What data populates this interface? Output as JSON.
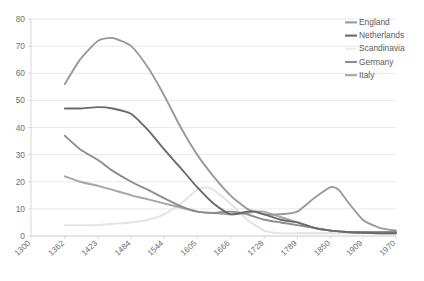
{
  "chart_data": {
    "type": "line",
    "title": "",
    "subtitle": "",
    "xlabel": "",
    "ylabel": "",
    "xlim": [
      1300,
      1970
    ],
    "ylim": [
      0,
      80
    ],
    "y_ticks": [
      0,
      10,
      20,
      30,
      40,
      50,
      60,
      70,
      80
    ],
    "x_ticks": [
      1300,
      1362,
      1423,
      1484,
      1544,
      1605,
      1666,
      1728,
      1789,
      1850,
      1909,
      1970
    ],
    "x_tick_labels": [
      "1300",
      "1362",
      "1423",
      "1484",
      "1544",
      "1605",
      "1666",
      "1728",
      "1789",
      "1850",
      "1909",
      "1970"
    ],
    "y_tick_labels": [
      "0",
      "10",
      "20",
      "30",
      "40",
      "50",
      "60",
      "70",
      "80"
    ],
    "grid": "horizontal",
    "legend_position": "top-right",
    "series": [
      {
        "name": "England",
        "color": "#9a9a9a",
        "x": [
          1362,
          1390,
          1423,
          1450,
          1484,
          1515,
          1544,
          1575,
          1605,
          1635,
          1666,
          1697,
          1728,
          1758,
          1789,
          1820,
          1850,
          1865,
          1880,
          1909,
          1940,
          1970
        ],
        "values": [
          56,
          65,
          72,
          73,
          70,
          62,
          52,
          40,
          30,
          22,
          15,
          10,
          8,
          8,
          9,
          14,
          18,
          17,
          13,
          6,
          3,
          2
        ]
      },
      {
        "name": "Netherlands",
        "color": "#6a6a6a",
        "x": [
          1362,
          1390,
          1423,
          1450,
          1484,
          1515,
          1544,
          1575,
          1605,
          1635,
          1666,
          1697,
          1712,
          1728,
          1758,
          1789,
          1820,
          1850,
          1880,
          1909,
          1940,
          1970
        ],
        "values": [
          47,
          47,
          47.5,
          47,
          45,
          39,
          32,
          25,
          18,
          12,
          8,
          9,
          9,
          8,
          6,
          5,
          3,
          2,
          1.5,
          1.2,
          1,
          1
        ]
      },
      {
        "name": "Scandinavia",
        "color": "#e3e3e3",
        "x": [
          1362,
          1390,
          1423,
          1450,
          1484,
          1515,
          1544,
          1575,
          1605,
          1620,
          1635,
          1666,
          1697,
          1728,
          1758,
          1789,
          1820,
          1850,
          1880,
          1909,
          1940,
          1970
        ],
        "values": [
          4,
          4,
          4,
          4.5,
          5,
          6,
          8,
          12,
          17,
          18,
          17,
          12,
          6,
          2,
          1,
          1,
          1,
          1,
          1,
          1,
          1,
          1
        ]
      },
      {
        "name": "Germany",
        "color": "#8d8d8d",
        "x": [
          1362,
          1390,
          1423,
          1450,
          1484,
          1515,
          1544,
          1575,
          1605,
          1635,
          1666,
          1697,
          1728,
          1758,
          1789,
          1820,
          1850,
          1880,
          1909,
          1940,
          1970
        ],
        "values": [
          37,
          32,
          28,
          24,
          20,
          17,
          14,
          11,
          9,
          8.5,
          9,
          8,
          6,
          5,
          4,
          3,
          2,
          1.5,
          1.5,
          1.5,
          1.5
        ]
      },
      {
        "name": "Italy",
        "color": "#a5a5a5",
        "x": [
          1362,
          1390,
          1423,
          1450,
          1484,
          1515,
          1544,
          1575,
          1605,
          1635,
          1666,
          1697,
          1712,
          1728,
          1758,
          1789,
          1820,
          1850,
          1880,
          1909,
          1940,
          1970
        ],
        "values": [
          22,
          20,
          18.5,
          17,
          15,
          13.5,
          12,
          10.5,
          9,
          8.5,
          8,
          8.5,
          9,
          9,
          7,
          5,
          3,
          2,
          1.5,
          1.2,
          1,
          1
        ]
      }
    ]
  },
  "legend": {
    "items": [
      {
        "label": "England",
        "color": "#9a9a9a",
        "has_swatch": true
      },
      {
        "label": "Netherlands",
        "color": "#6a6a6a",
        "has_swatch": true
      },
      {
        "label": "Scandinavia",
        "color": "#ededed",
        "has_swatch": true
      },
      {
        "label": "Germany",
        "color": "#8d8d8d",
        "has_swatch": true
      },
      {
        "label": "Italy",
        "color": "#a5a5a5",
        "has_swatch": true
      }
    ]
  },
  "style": {
    "background": "#ffffff",
    "gridline_color": "#e2e2e2",
    "axis_color": "#d2d2d2",
    "tick_label_color": "#6f6f6f",
    "plot_left": 31,
    "plot_right": 396,
    "plot_top": 19,
    "plot_bottom": 236
  }
}
